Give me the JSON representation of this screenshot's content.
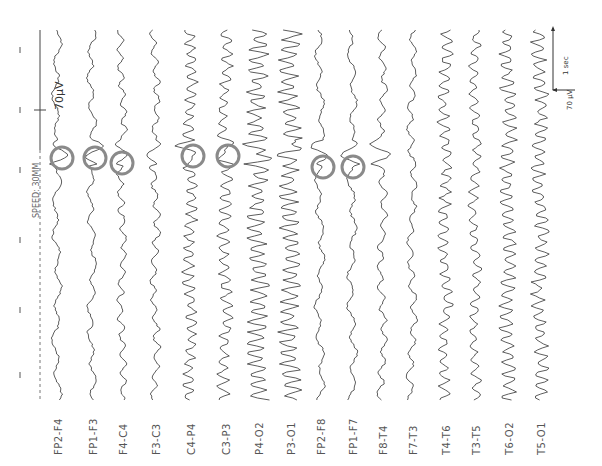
{
  "recording": {
    "speed_label": "SPEED: 30MM",
    "calibration_label": "70μV",
    "scale_bar": {
      "amplitude_label": "70 μV",
      "time_label": "1 sec"
    },
    "channels": [
      {
        "label": "FP2-F4",
        "x": 57,
        "amp": 3,
        "freq": 0.18
      },
      {
        "label": "FP1-F3",
        "x": 92,
        "amp": 3,
        "freq": 0.22
      },
      {
        "label": "F4-C4",
        "x": 122,
        "amp": 3,
        "freq": 0.35
      },
      {
        "label": "F3-C3",
        "x": 155,
        "amp": 3,
        "freq": 0.33
      },
      {
        "label": "C4-P4",
        "x": 190,
        "amp": 5,
        "freq": 0.55
      },
      {
        "label": "C3-P3",
        "x": 225,
        "amp": 5,
        "freq": 0.5
      },
      {
        "label": "P4-O2",
        "x": 258,
        "amp": 8,
        "freq": 0.6
      },
      {
        "label": "P3-O1",
        "x": 290,
        "amp": 8,
        "freq": 0.6
      },
      {
        "label": "FP2-F8",
        "x": 320,
        "amp": 3,
        "freq": 0.2
      },
      {
        "label": "FP1-F7",
        "x": 352,
        "amp": 3,
        "freq": 0.2
      },
      {
        "label": "F8-T4",
        "x": 382,
        "amp": 3,
        "freq": 0.3
      },
      {
        "label": "F7-T3",
        "x": 412,
        "amp": 3,
        "freq": 0.28
      },
      {
        "label": "T4-T6",
        "x": 445,
        "amp": 5,
        "freq": 0.5
      },
      {
        "label": "T3-T5",
        "x": 475,
        "amp": 4,
        "freq": 0.45
      },
      {
        "label": "T6-O2",
        "x": 508,
        "amp": 6,
        "freq": 0.55
      },
      {
        "label": "T5-O1",
        "x": 540,
        "amp": 6,
        "freq": 0.55
      }
    ],
    "highlighted_spikes": [
      {
        "cx": 62,
        "cy": 158
      },
      {
        "cx": 95,
        "cy": 158
      },
      {
        "cx": 122,
        "cy": 163
      },
      {
        "cx": 193,
        "cy": 156
      },
      {
        "cx": 228,
        "cy": 156
      },
      {
        "cx": 323,
        "cy": 167
      },
      {
        "cx": 353,
        "cy": 167
      }
    ],
    "colors": {
      "trace": "#333333",
      "circle": "#8a8a8a",
      "label": "#555555"
    }
  }
}
